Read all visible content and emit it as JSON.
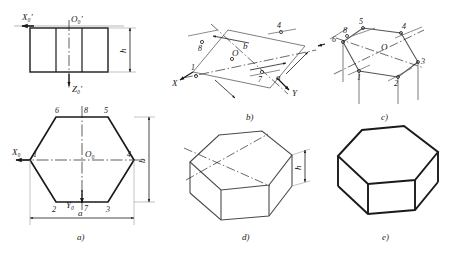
{
  "figure": {
    "background_color": "#ffffff",
    "ink_color": "#1a1a1a",
    "thin_color": "#8a8a8a",
    "panels": [
      {
        "key": "a",
        "caption": "a)",
        "description": "Orthographic views: front elevation and top view hexagon",
        "labels": {
          "front_axis_x": "X₀′",
          "front_axis_z": "Z₀′",
          "front_origin": "O₀′",
          "front_height": "h",
          "top_axis_x": "X₀",
          "top_axis_y": "Y₀",
          "top_origin": "O₀",
          "width": "a",
          "depth": "b"
        },
        "vertices": [
          "1",
          "2",
          "3",
          "4",
          "5",
          "6",
          "7",
          "8"
        ]
      },
      {
        "key": "b",
        "caption": "b)",
        "description": "Isometric axes with enclosing parallelogram a by b",
        "labels": {
          "axis_x": "X",
          "axis_y": "Y",
          "origin": "O",
          "dim_a": "a",
          "dim_b": "b"
        },
        "vertices": [
          "1",
          "4",
          "7",
          "8"
        ]
      },
      {
        "key": "c",
        "caption": "c)",
        "description": "Hexagon vertices located on the isometric parallelogram",
        "labels": {
          "origin": "O"
        },
        "vertices": [
          "1",
          "2",
          "3",
          "4",
          "5",
          "6",
          "8"
        ]
      },
      {
        "key": "d",
        "caption": "d)",
        "description": "Hexagonal base extruded downward by height h",
        "labels": {
          "height": "h"
        },
        "vertices": []
      },
      {
        "key": "e",
        "caption": "e)",
        "description": "Completed solid hexagonal prism with hidden lines removed",
        "labels": {},
        "vertices": []
      }
    ]
  }
}
